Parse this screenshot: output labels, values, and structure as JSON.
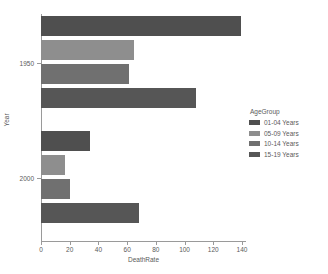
{
  "chart_data": {
    "type": "bar",
    "orientation": "horizontal",
    "grouped": true,
    "title": "",
    "xlabel": "DeathRate",
    "ylabel": "Year",
    "categories": [
      "1950",
      "2000"
    ],
    "xlim": [
      0,
      140
    ],
    "xticks": [
      0,
      20,
      40,
      60,
      80,
      100,
      120,
      140
    ],
    "xtick_labels": [
      "0",
      "20",
      "40",
      "60",
      "80",
      "100",
      "120",
      "140"
    ],
    "ytick_labels": [
      "1950",
      "2000"
    ],
    "grid": false,
    "legend_position": "right",
    "legend_title": "AgeGroup",
    "series": [
      {
        "name": "01-04 Years",
        "color": "#4f4f4f",
        "values": [
          139,
          34
        ]
      },
      {
        "name": "05-09 Years",
        "color": "#8e8e8e",
        "values": [
          65,
          17
        ]
      },
      {
        "name": "10-14 Years",
        "color": "#707070",
        "values": [
          61,
          20
        ]
      },
      {
        "name": "15-19 Years",
        "color": "#565656",
        "values": [
          108,
          68
        ]
      }
    ]
  },
  "axes": {
    "x_title": "DeathRate",
    "y_title": "Year"
  },
  "legend": {
    "title": "AgeGroup",
    "items": [
      {
        "label": "01-04 Years"
      },
      {
        "label": "05-09 Years"
      },
      {
        "label": "10-14 Years"
      },
      {
        "label": "15-19 Years"
      }
    ]
  }
}
